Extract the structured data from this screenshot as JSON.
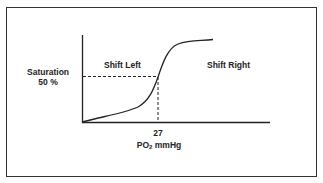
{
  "diagram": {
    "y_label_line1": "Saturation",
    "y_label_line2": "50 %",
    "region_left": "Shift Left",
    "region_right": "Shift Right",
    "x_tick_value": "27",
    "x_label_prefix": "PO",
    "x_label_sub": "2",
    "x_label_suffix": " mmHg",
    "colors": {
      "line": "#222222",
      "frame": "#333333",
      "text": "#222222",
      "background": "#ffffff"
    }
  }
}
